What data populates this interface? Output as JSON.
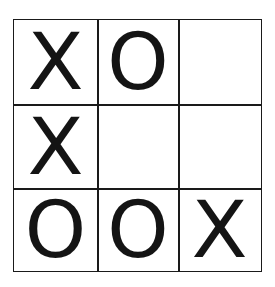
{
  "game": "tic-tac-toe",
  "board": {
    "rows": 3,
    "cols": 3,
    "cells": [
      [
        "X",
        "O",
        ""
      ],
      [
        "X",
        "",
        ""
      ],
      [
        "O",
        "O",
        "X"
      ]
    ]
  },
  "colors": {
    "background": "#ffffff",
    "grid_line": "#1a1a1a",
    "mark": "#141414"
  }
}
